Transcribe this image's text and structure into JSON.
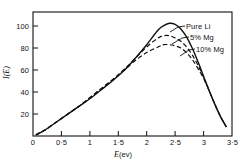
{
  "chart_data": {
    "type": "line",
    "title": "",
    "xlabel": "E (ev)",
    "xlabel_symbol": "E",
    "xlabel_unit": "(ev)",
    "ylabel": "I(E)",
    "xlim": [
      0,
      3.5
    ],
    "ylim": [
      0,
      110
    ],
    "grid": false,
    "legend_position": "inline-right-annotations",
    "xticks": [
      0,
      0.5,
      1,
      1.5,
      2,
      2.5,
      3,
      3.5
    ],
    "xtick_labels": [
      "0",
      "0·5",
      "1",
      "1·5",
      "2",
      "2·5",
      "3",
      "3·5"
    ],
    "yticks": [
      20,
      40,
      60,
      80,
      100
    ],
    "ytick_labels": [
      "20",
      "40",
      "60",
      "80",
      "100"
    ],
    "series": [
      {
        "name": "Pure Li",
        "style": "solid",
        "color": "#111111",
        "peak_x": 2.4,
        "peak_y": 100,
        "x": [
          0.05,
          0.2,
          0.4,
          0.6,
          0.8,
          1.0,
          1.2,
          1.4,
          1.6,
          1.8,
          2.0,
          2.2,
          2.3,
          2.4,
          2.5,
          2.6,
          2.7,
          2.8,
          2.9,
          3.0,
          3.1,
          3.2,
          3.3,
          3.4
        ],
        "values": [
          1,
          5,
          12,
          19,
          26,
          33,
          41,
          49,
          58,
          69,
          81,
          94,
          98,
          100,
          99,
          95,
          88,
          78,
          66,
          53,
          40,
          28,
          17,
          8
        ]
      },
      {
        "name": "5% Mg",
        "style": "dashed",
        "color": "#111111",
        "peak_x": 2.35,
        "peak_y": 89,
        "x": [
          0.05,
          0.2,
          0.4,
          0.6,
          0.8,
          1.0,
          1.2,
          1.4,
          1.6,
          1.8,
          2.0,
          2.2,
          2.3,
          2.4,
          2.5,
          2.6,
          2.7,
          2.8,
          2.9,
          3.0,
          3.1,
          3.2,
          3.3,
          3.4
        ],
        "values": [
          1,
          5,
          12,
          19,
          26,
          34,
          42,
          50,
          59,
          69,
          79,
          87,
          89,
          89,
          87,
          84,
          79,
          72,
          63,
          52,
          40,
          28,
          17,
          8
        ]
      },
      {
        "name": "10% Mg",
        "style": "dashed",
        "color": "#111111",
        "peak_x": 2.3,
        "peak_y": 81,
        "x": [
          0.05,
          0.2,
          0.4,
          0.6,
          0.8,
          1.0,
          1.2,
          1.4,
          1.6,
          1.8,
          2.0,
          2.2,
          2.3,
          2.4,
          2.5,
          2.6,
          2.7,
          2.8,
          2.9,
          3.0,
          3.1,
          3.2,
          3.3,
          3.4
        ],
        "values": [
          1,
          5,
          12,
          19,
          26,
          34,
          42,
          50,
          58,
          67,
          74,
          79,
          81,
          81,
          80,
          78,
          74,
          68,
          60,
          51,
          40,
          28,
          17,
          8
        ]
      }
    ],
    "annotations": [
      {
        "text": "Pure Li",
        "for_series": "Pure Li"
      },
      {
        "text": "5% Mg",
        "for_series": "5% Mg"
      },
      {
        "text": "10% Mg",
        "for_series": "10% Mg"
      }
    ]
  }
}
